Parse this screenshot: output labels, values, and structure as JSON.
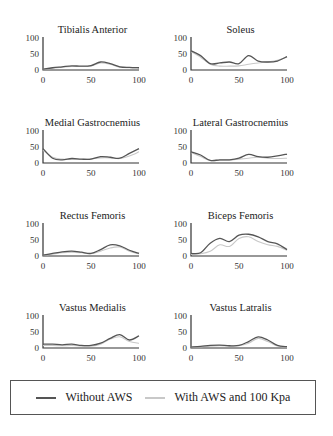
{
  "chart_data": {
    "type": "line",
    "layout": "4x2 small multiples",
    "xlim": [
      0,
      100
    ],
    "ylim": [
      0,
      100
    ],
    "xticks": [
      "0",
      "50",
      "100"
    ],
    "yticks": [
      "100",
      "50",
      "0"
    ],
    "legend": {
      "position": "bottom",
      "entries": [
        {
          "name": "Without AWS",
          "color": "#555555"
        },
        {
          "name": "With AWS and 100 Kpa",
          "color": "#c8c8c8"
        }
      ]
    },
    "x": [
      0,
      10,
      20,
      30,
      40,
      50,
      60,
      70,
      80,
      90,
      100
    ],
    "panels": [
      {
        "title": "Tibialis Anterior",
        "series": [
          {
            "name": "Without AWS",
            "values": [
              3,
              7,
              10,
              13,
              12,
              14,
              25,
              20,
              10,
              8,
              7
            ]
          },
          {
            "name": "With AWS and 100 Kpa",
            "values": [
              2,
              6,
              9,
              11,
              11,
              12,
              22,
              18,
              9,
              7,
              6
            ]
          }
        ]
      },
      {
        "title": "Soleus",
        "series": [
          {
            "name": "Without AWS",
            "values": [
              60,
              45,
              20,
              22,
              25,
              20,
              45,
              28,
              25,
              28,
              42
            ]
          },
          {
            "name": "With AWS and 100 Kpa",
            "values": [
              58,
              40,
              18,
              12,
              12,
              13,
              18,
              22,
              25,
              30,
              40
            ]
          }
        ]
      },
      {
        "title": "Medial Gastrocnemius",
        "series": [
          {
            "name": "Without AWS",
            "values": [
              45,
              15,
              10,
              14,
              12,
              12,
              20,
              18,
              15,
              30,
              45
            ]
          },
          {
            "name": "With AWS and 100 Kpa",
            "values": [
              40,
              18,
              12,
              12,
              11,
              13,
              16,
              16,
              14,
              22,
              35
            ]
          }
        ]
      },
      {
        "title": "Lateral Gastrocnemius",
        "series": [
          {
            "name": "Without AWS",
            "values": [
              35,
              25,
              8,
              10,
              10,
              15,
              27,
              20,
              18,
              22,
              28
            ]
          },
          {
            "name": "With AWS and 100 Kpa",
            "values": [
              33,
              20,
              8,
              9,
              9,
              12,
              15,
              18,
              15,
              14,
              15
            ]
          }
        ]
      },
      {
        "title": "Rectus Femoris",
        "series": [
          {
            "name": "Without AWS",
            "values": [
              3,
              8,
              13,
              15,
              12,
              8,
              20,
              35,
              32,
              18,
              8
            ]
          },
          {
            "name": "With AWS and 100 Kpa",
            "values": [
              2,
              6,
              10,
              12,
              10,
              7,
              15,
              25,
              28,
              15,
              6
            ]
          }
        ]
      },
      {
        "title": "Biceps Femoris",
        "series": [
          {
            "name": "Without AWS",
            "values": [
              8,
              10,
              40,
              55,
              45,
              65,
              68,
              60,
              45,
              38,
              20
            ]
          },
          {
            "name": "With AWS and 100 Kpa",
            "values": [
              5,
              7,
              15,
              35,
              30,
              55,
              60,
              45,
              35,
              30,
              18
            ]
          }
        ]
      },
      {
        "title": "Vastus Medialis",
        "series": [
          {
            "name": "Without AWS",
            "values": [
              12,
              12,
              10,
              12,
              8,
              8,
              15,
              30,
              42,
              25,
              38
            ]
          },
          {
            "name": "With AWS and 100 Kpa",
            "values": [
              8,
              8,
              7,
              8,
              6,
              6,
              12,
              28,
              35,
              20,
              15
            ]
          }
        ]
      },
      {
        "title": "Vastus Latralis",
        "series": [
          {
            "name": "Without AWS",
            "values": [
              3,
              5,
              8,
              9,
              7,
              8,
              20,
              35,
              25,
              8,
              4
            ]
          },
          {
            "name": "With AWS and 100 Kpa",
            "values": [
              2,
              4,
              6,
              7,
              6,
              7,
              15,
              30,
              20,
              6,
              3
            ]
          }
        ]
      }
    ]
  }
}
